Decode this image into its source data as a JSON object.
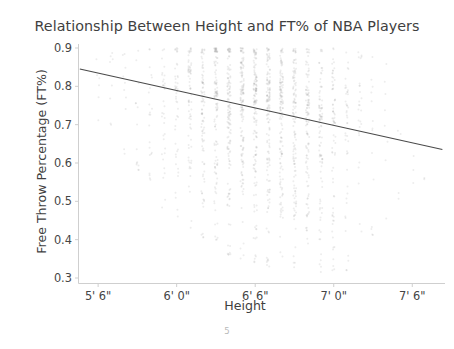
{
  "chart_data": {
    "type": "scatter",
    "title": "Relationship Between Height and FT% of NBA Players",
    "xlabel": "Height",
    "ylabel": "Free Throw Percentage (FT%)",
    "xtick_labels": [
      "5' 6\"",
      "6' 0\"",
      "6' 6\"",
      "7' 0\"",
      "7' 6\""
    ],
    "xtick_values": [
      66,
      72,
      78,
      84,
      90
    ],
    "ytick_labels": [
      "0.3",
      "0.4",
      "0.5",
      "0.6",
      "0.7",
      "0.8",
      "0.9"
    ],
    "ytick_values": [
      0.3,
      0.4,
      0.5,
      0.6,
      0.7,
      0.8,
      0.9
    ],
    "xlim": [
      64.5,
      92.5
    ],
    "ylim": [
      0.3,
      0.9
    ],
    "grid": false,
    "legend": null,
    "point_color": "#9a9a9a",
    "point_alpha": 0.18,
    "point_size": 2.0,
    "trendline": {
      "type": "linear-fit",
      "color": "#4a4a4a",
      "x_start": 64.6,
      "y_start": 0.845,
      "x_end": 92.3,
      "y_end": 0.635,
      "slope_per_inch": -0.00758
    },
    "series": [
      {
        "name": "NBA players",
        "note": "Heights are discrete whole inches, producing vertical stripes of points.",
        "columns": [
          {
            "height_in": 66,
            "label": "5' 6\"",
            "count": 6,
            "ft_center": 0.8,
            "ft_spread": 0.07,
            "ft_min": 0.7,
            "ft_max": 0.88
          },
          {
            "height_in": 67,
            "label": "5' 7\"",
            "count": 8,
            "ft_center": 0.8,
            "ft_spread": 0.07,
            "ft_min": 0.68,
            "ft_max": 0.89
          },
          {
            "height_in": 68,
            "label": "5' 8\"",
            "count": 10,
            "ft_center": 0.79,
            "ft_spread": 0.08,
            "ft_min": 0.62,
            "ft_max": 0.89
          },
          {
            "height_in": 69,
            "label": "5' 9\"",
            "count": 14,
            "ft_center": 0.79,
            "ft_spread": 0.08,
            "ft_min": 0.58,
            "ft_max": 0.9
          },
          {
            "height_in": 70,
            "label": "5' 10\"",
            "count": 22,
            "ft_center": 0.79,
            "ft_spread": 0.08,
            "ft_min": 0.55,
            "ft_max": 0.9
          },
          {
            "height_in": 71,
            "label": "5' 11\"",
            "count": 34,
            "ft_center": 0.79,
            "ft_spread": 0.09,
            "ft_min": 0.48,
            "ft_max": 0.9
          },
          {
            "height_in": 72,
            "label": "6' 0\"",
            "count": 48,
            "ft_center": 0.78,
            "ft_spread": 0.09,
            "ft_min": 0.44,
            "ft_max": 0.9
          },
          {
            "height_in": 73,
            "label": "6' 1\"",
            "count": 70,
            "ft_center": 0.78,
            "ft_spread": 0.09,
            "ft_min": 0.42,
            "ft_max": 0.9
          },
          {
            "height_in": 74,
            "label": "6' 2\"",
            "count": 92,
            "ft_center": 0.77,
            "ft_spread": 0.09,
            "ft_min": 0.4,
            "ft_max": 0.9
          },
          {
            "height_in": 75,
            "label": "6' 3\"",
            "count": 118,
            "ft_center": 0.77,
            "ft_spread": 0.09,
            "ft_min": 0.38,
            "ft_max": 0.9
          },
          {
            "height_in": 76,
            "label": "6' 4\"",
            "count": 132,
            "ft_center": 0.76,
            "ft_spread": 0.09,
            "ft_min": 0.36,
            "ft_max": 0.9
          },
          {
            "height_in": 77,
            "label": "6' 5\"",
            "count": 140,
            "ft_center": 0.76,
            "ft_spread": 0.09,
            "ft_min": 0.35,
            "ft_max": 0.9
          },
          {
            "height_in": 78,
            "label": "6' 6\"",
            "count": 150,
            "ft_center": 0.75,
            "ft_spread": 0.1,
            "ft_min": 0.34,
            "ft_max": 0.9
          },
          {
            "height_in": 79,
            "label": "6' 7\"",
            "count": 144,
            "ft_center": 0.75,
            "ft_spread": 0.1,
            "ft_min": 0.33,
            "ft_max": 0.9
          },
          {
            "height_in": 80,
            "label": "6' 8\"",
            "count": 138,
            "ft_center": 0.74,
            "ft_spread": 0.1,
            "ft_min": 0.33,
            "ft_max": 0.9
          },
          {
            "height_in": 81,
            "label": "6' 9\"",
            "count": 126,
            "ft_center": 0.73,
            "ft_spread": 0.1,
            "ft_min": 0.32,
            "ft_max": 0.9
          },
          {
            "height_in": 82,
            "label": "6' 10\"",
            "count": 112,
            "ft_center": 0.72,
            "ft_spread": 0.1,
            "ft_min": 0.32,
            "ft_max": 0.9
          },
          {
            "height_in": 83,
            "label": "6' 11\"",
            "count": 94,
            "ft_center": 0.71,
            "ft_spread": 0.11,
            "ft_min": 0.31,
            "ft_max": 0.9
          },
          {
            "height_in": 84,
            "label": "7' 0\"",
            "count": 72,
            "ft_center": 0.7,
            "ft_spread": 0.11,
            "ft_min": 0.31,
            "ft_max": 0.9
          },
          {
            "height_in": 85,
            "label": "7' 1\"",
            "count": 44,
            "ft_center": 0.69,
            "ft_spread": 0.11,
            "ft_min": 0.32,
            "ft_max": 0.9
          },
          {
            "height_in": 86,
            "label": "7' 2\"",
            "count": 26,
            "ft_center": 0.68,
            "ft_spread": 0.11,
            "ft_min": 0.34,
            "ft_max": 0.89
          },
          {
            "height_in": 87,
            "label": "7' 3\"",
            "count": 14,
            "ft_center": 0.67,
            "ft_spread": 0.11,
            "ft_min": 0.4,
            "ft_max": 0.88
          },
          {
            "height_in": 88,
            "label": "7' 4\"",
            "count": 8,
            "ft_center": 0.66,
            "ft_spread": 0.1,
            "ft_min": 0.45,
            "ft_max": 0.86
          },
          {
            "height_in": 89,
            "label": "7' 5\"",
            "count": 4,
            "ft_center": 0.65,
            "ft_spread": 0.09,
            "ft_min": 0.5,
            "ft_max": 0.82
          },
          {
            "height_in": 90,
            "label": "7' 6\"",
            "count": 3,
            "ft_center": 0.64,
            "ft_spread": 0.08,
            "ft_min": 0.52,
            "ft_max": 0.78
          },
          {
            "height_in": 91,
            "label": "7' 7\"",
            "count": 2,
            "ft_center": 0.63,
            "ft_spread": 0.07,
            "ft_min": 0.55,
            "ft_max": 0.72
          }
        ]
      }
    ]
  },
  "footer": {
    "page_number": "5"
  }
}
